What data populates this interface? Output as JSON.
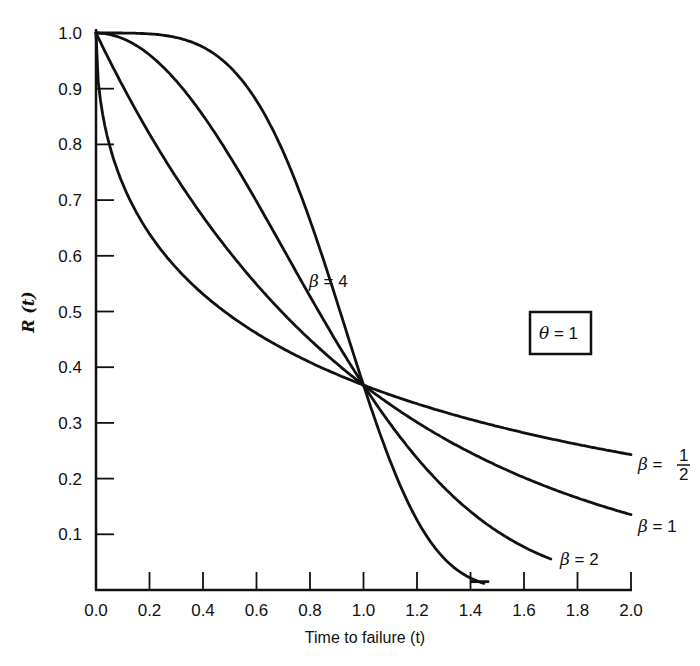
{
  "chart_data": {
    "type": "line",
    "title": "",
    "xlabel": "Time to failure (t)",
    "ylabel": "R (t)",
    "xlim": [
      0.0,
      2.0
    ],
    "ylim": [
      0.0,
      1.0
    ],
    "grid": false,
    "legend_position": "inline labels at curve ends",
    "x_ticks": [
      "0.0",
      "0.2",
      "0.4",
      "0.6",
      "0.8",
      "1.0",
      "1.2",
      "1.4",
      "1.6",
      "1.8",
      "2.0"
    ],
    "y_ticks": [
      "0.1",
      "0.2",
      "0.3",
      "0.4",
      "0.5",
      "0.6",
      "0.7",
      "0.8",
      "0.9",
      "1.0"
    ],
    "annotation": {
      "text": "θ = 1",
      "boxed": true
    },
    "series": [
      {
        "name": "β = 1/2",
        "beta": 0.5,
        "label": "β = ½",
        "t_end": 2.0,
        "x": [
          0.0,
          0.05,
          0.1,
          0.2,
          0.4,
          0.6,
          0.8,
          1.0,
          1.2,
          1.4,
          1.6,
          1.8,
          2.0
        ],
        "values": [
          1.0,
          0.8,
          0.73,
          0.64,
          0.53,
          0.46,
          0.41,
          0.37,
          0.33,
          0.31,
          0.28,
          0.26,
          0.24
        ]
      },
      {
        "name": "β = 1",
        "beta": 1,
        "label": "β = 1",
        "t_end": 2.0,
        "x": [
          0.0,
          0.2,
          0.4,
          0.6,
          0.8,
          1.0,
          1.2,
          1.4,
          1.6,
          1.8,
          2.0
        ],
        "values": [
          1.0,
          0.82,
          0.67,
          0.55,
          0.45,
          0.37,
          0.3,
          0.25,
          0.2,
          0.17,
          0.14
        ]
      },
      {
        "name": "β = 2",
        "beta": 2,
        "label": "β = 2",
        "t_end": 1.7,
        "x": [
          0.0,
          0.2,
          0.4,
          0.6,
          0.8,
          1.0,
          1.2,
          1.4,
          1.6,
          1.7
        ],
        "values": [
          1.0,
          0.96,
          0.85,
          0.7,
          0.53,
          0.37,
          0.24,
          0.14,
          0.08,
          0.06
        ]
      },
      {
        "name": "β = 4",
        "beta": 4,
        "label": "β = 4",
        "t_end": 1.45,
        "x": [
          0.0,
          0.2,
          0.4,
          0.6,
          0.8,
          1.0,
          1.2,
          1.4,
          1.45
        ],
        "values": [
          1.0,
          1.0,
          0.97,
          0.88,
          0.66,
          0.37,
          0.13,
          0.02,
          0.01
        ]
      }
    ]
  },
  "labels": {
    "beta_half_prefix": "β = ",
    "beta_half_num": "1",
    "beta_half_den": "2",
    "beta_1": "β = 1",
    "beta_2": "β = 2",
    "beta_4": "β = 4",
    "theta_box": "θ = 1"
  }
}
